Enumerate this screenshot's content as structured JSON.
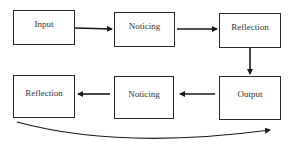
{
  "diagram": {
    "nodes": [
      {
        "id": "input",
        "label": "Input",
        "row": 1,
        "col": 1
      },
      {
        "id": "noticing-1",
        "label": "Noticing",
        "row": 1,
        "col": 2
      },
      {
        "id": "reflection-1",
        "label": "Reflection",
        "row": 1,
        "col": 3
      },
      {
        "id": "output",
        "label": "Output",
        "row": 2,
        "col": 3
      },
      {
        "id": "noticing-2",
        "label": "Noticing",
        "row": 2,
        "col": 2
      },
      {
        "id": "reflection-2",
        "label": "Reflection",
        "row": 2,
        "col": 1
      }
    ],
    "edges": [
      {
        "from": "input",
        "to": "noticing-1"
      },
      {
        "from": "noticing-1",
        "to": "reflection-1"
      },
      {
        "from": "reflection-1",
        "to": "output"
      },
      {
        "from": "output",
        "to": "noticing-2"
      },
      {
        "from": "noticing-2",
        "to": "reflection-2"
      },
      {
        "from": "reflection-2",
        "to": "output",
        "style": "curved",
        "direction": "left-to-right"
      }
    ],
    "colors": {
      "stroke": "#2a2a2a",
      "text": "#333333",
      "background": "#ffffff"
    }
  }
}
